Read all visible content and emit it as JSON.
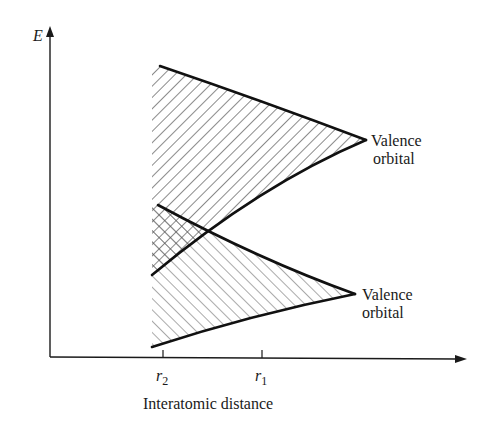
{
  "diagram": {
    "type": "energy-band diagram",
    "y_axis": {
      "label": "E"
    },
    "x_axis": {
      "label": "Interatomic distance",
      "ticks": [
        {
          "id": "r2",
          "base": "r",
          "subscript": "2"
        },
        {
          "id": "r1",
          "base": "r",
          "subscript": "1"
        }
      ]
    },
    "bands": [
      {
        "id": "upper",
        "label_line1": "Valence",
        "label_line2": "orbital",
        "hatch": "diagonal-down"
      },
      {
        "id": "lower",
        "label_line1": "Valence",
        "label_line2": "orbital",
        "hatch": "diagonal-up"
      }
    ],
    "overlap_region": {
      "hatch": "cross-hatch"
    }
  },
  "colors": {
    "ink": "#1a1a1a",
    "background": "#ffffff"
  }
}
